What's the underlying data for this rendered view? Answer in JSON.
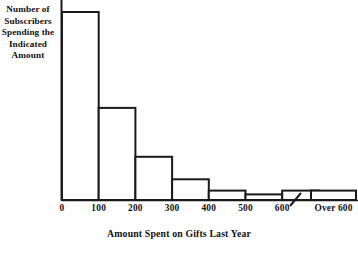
{
  "chart_data": {
    "type": "bar",
    "title": "",
    "subtitle": "",
    "xlabel": "Amount Spent on Gifts Last Year",
    "ylabel": "Number of Subscribers Spending the Indicated Amount",
    "ylabel_lines": [
      "Number of",
      "Subscribers",
      "Spending the",
      "Indicated",
      "Amount"
    ],
    "categories": [
      "0-100",
      "100-200",
      "200-300",
      "300-400",
      "400-500",
      "500-600",
      "Over 600"
    ],
    "values": [
      100,
      49,
      23,
      11,
      5,
      3,
      5
    ],
    "bin_edges": [
      0,
      100,
      200,
      300,
      400,
      500,
      600
    ],
    "xticks": [
      "0",
      "100",
      "200",
      "300",
      "400",
      "500",
      "600"
    ],
    "detached_category": "Over 600",
    "axis_break": true,
    "grid": false,
    "legend": false,
    "ylim": [
      0,
      100
    ],
    "yticks": [],
    "bar_fill": "#ffffff",
    "bar_stroke": "#1a1a1a",
    "axis_color": "#1a1a1a",
    "background": "#fefefe"
  }
}
